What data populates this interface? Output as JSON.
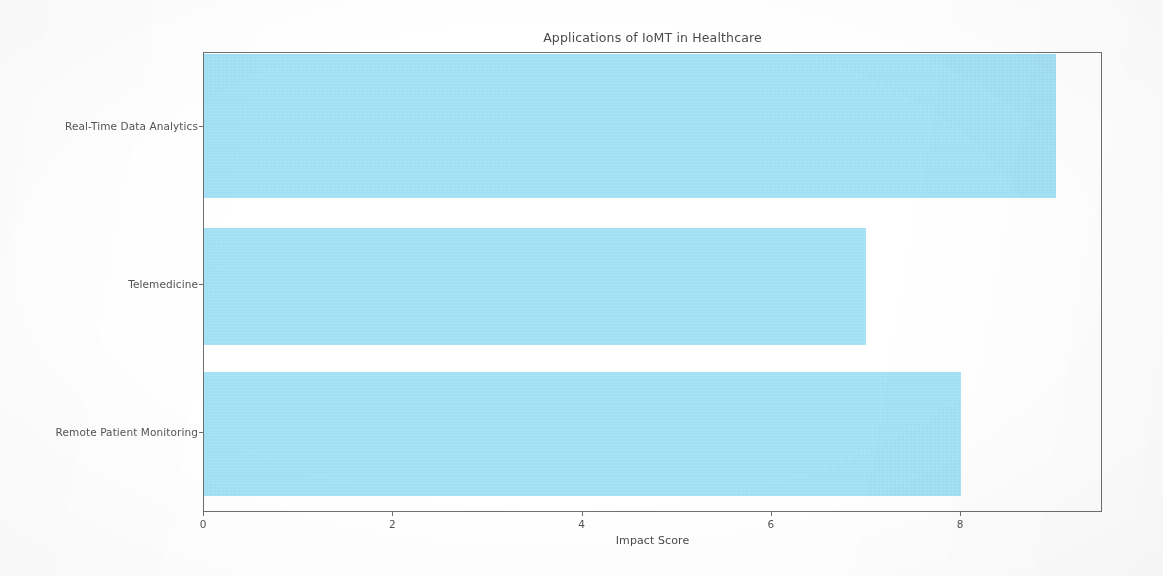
{
  "chart_data": {
    "type": "bar",
    "orientation": "horizontal",
    "title": "Applications of IoMT in Healthcare",
    "xlabel": "Impact Score",
    "ylabel": "",
    "categories": [
      "Remote Patient Monitoring",
      "Telemedicine",
      "Real-Time Data Analytics"
    ],
    "values": [
      8,
      7,
      9
    ],
    "xlim": [
      0,
      9.5
    ],
    "xticks": [
      0,
      2,
      4,
      6,
      8
    ],
    "xtick_labels": [
      "0",
      "2",
      "4",
      "6",
      "8"
    ],
    "grid": false,
    "legend": null,
    "bar_color": "#9fe0f4",
    "background_color": "#ffffff",
    "axis_color": "#6e6e6e",
    "text_color": "#545454"
  }
}
